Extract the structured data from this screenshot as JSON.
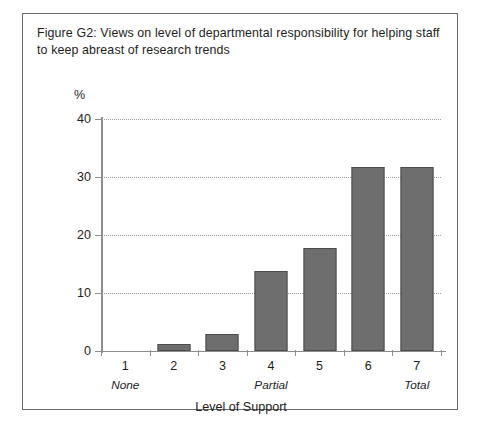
{
  "figure": {
    "title": "Figure G2: Views on level of departmental responsibility for helping staff to keep abreast of research trends",
    "frame_color": "#6b6b6b"
  },
  "chart_data": {
    "type": "bar",
    "title": "Figure G2: Views on level of departmental responsibility for helping staff to keep abreast of research trends",
    "xlabel": "Level of Support",
    "ylabel": "%",
    "categories": [
      "1",
      "2",
      "3",
      "4",
      "5",
      "6",
      "7"
    ],
    "values": [
      0,
      1.2,
      3.0,
      13.8,
      17.8,
      31.8,
      31.8
    ],
    "category_sublabels": [
      "None",
      "",
      "",
      "Partial",
      "",
      "",
      "Total"
    ],
    "ylim": [
      0,
      40
    ],
    "yticks": [
      0,
      10,
      20,
      30,
      40
    ],
    "ytick_labels": [
      "0",
      "10",
      "20",
      "30",
      "40"
    ],
    "grid": true,
    "grid_axis": "y",
    "grid_style": "dotted",
    "legend": false,
    "bar_color": "#6e6e6e",
    "bar_edge_color": "#4c4c4c",
    "axis_color": "#8d8d8d",
    "grid_color": "#9a9a9a"
  }
}
